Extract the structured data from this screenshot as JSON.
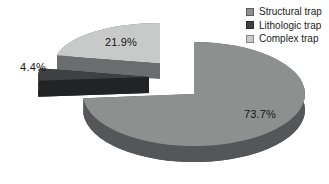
{
  "chart_data": {
    "type": "pie",
    "style": "3d-exploded",
    "title": "",
    "background": "#ffffff",
    "legend_position": "top-right",
    "series": [
      {
        "label": "Structural trap",
        "value": 73.7,
        "data_label": "73.7%",
        "color_top": "#8e9090",
        "color_side": "#545658"
      },
      {
        "label": "Lithologic trap",
        "value": 4.4,
        "data_label": "4.4%",
        "color_top": "#3e4041",
        "color_side": "#222324"
      },
      {
        "label": "Complex trap",
        "value": 21.9,
        "data_label": "21.9%",
        "color_top": "#c8caca",
        "color_side": "#6b6d6e"
      }
    ],
    "label_color": "#161616",
    "legend_text_color": "#1c1c1c"
  }
}
